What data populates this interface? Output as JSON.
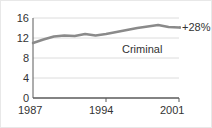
{
  "chart_data": {
    "type": "line",
    "title": "",
    "subtitle": "",
    "xlabel": "",
    "ylabel": "",
    "xlim": [
      1987,
      2001
    ],
    "ylim": [
      0,
      16
    ],
    "grid": true,
    "grid_axis": "y",
    "legend_position": "inline-label",
    "series": [
      {
        "name": "Criminal",
        "color": "#8a8a8a",
        "x": [
          1987,
          1988,
          1989,
          1990,
          1991,
          1992,
          1993,
          1994,
          1995,
          1996,
          1997,
          1998,
          1999,
          2000,
          2001
        ],
        "values": [
          11.0,
          11.7,
          12.3,
          12.5,
          12.4,
          12.8,
          12.5,
          12.8,
          13.2,
          13.6,
          14.0,
          14.3,
          14.6,
          14.2,
          14.1
        ]
      }
    ],
    "y_ticks": [
      0,
      4,
      8,
      12,
      16
    ],
    "y_tick_labels": [
      "0",
      "4",
      "8",
      "12",
      "16"
    ],
    "x_ticks": [
      1987,
      1994,
      2001
    ],
    "x_tick_labels": [
      "1987",
      "1994",
      "2001"
    ],
    "annotations": [
      {
        "id": "change",
        "text": "+28%",
        "x": 2001,
        "y": 14.1,
        "placement": "line-end-right"
      },
      {
        "id": "series_label",
        "text": "Criminal",
        "x": 1996,
        "y": 10.5,
        "placement": "below-line"
      }
    ],
    "colors": {
      "line": "#8a8a8a",
      "axis": "#5a5a5a",
      "grid": "#dcdcdc",
      "text": "#333333",
      "background": "#ffffff",
      "frame": "#e8e8e8"
    }
  },
  "axes": {
    "y_labels": [
      {
        "text": "16",
        "top": 12
      },
      {
        "text": "12",
        "top": 32
      },
      {
        "text": "8",
        "top": 52
      },
      {
        "text": "4",
        "top": 72
      },
      {
        "text": "0",
        "top": 92
      }
    ],
    "x_labels": [
      {
        "text": "1987",
        "left": 17
      },
      {
        "text": "1994",
        "left": 88
      },
      {
        "text": "2001",
        "left": 159
      }
    ]
  }
}
